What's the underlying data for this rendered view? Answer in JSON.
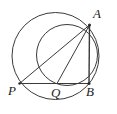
{
  "figure": {
    "kind": "geometry-diagram",
    "width": 117,
    "height": 114,
    "background_color": "#ffffff",
    "stroke_color": "#3a3a3a",
    "label_color": "#222222"
  },
  "points": {
    "A": {
      "label": "A",
      "x": 89.5,
      "y": 25.0,
      "label_x": 93,
      "label_y": 7
    },
    "B": {
      "label": "B",
      "x": 89.0,
      "y": 83.5,
      "label_x": 86,
      "label_y": 85
    },
    "P": {
      "label": "P",
      "x": 19.5,
      "y": 83.5,
      "label_x": 8,
      "label_y": 84
    },
    "Q": {
      "label": "Q",
      "x": 57.0,
      "y": 83.5,
      "label_x": 51,
      "label_y": 86
    }
  },
  "circles": [
    {
      "name": "large-circle",
      "cx": 55.5,
      "cy": 56.0,
      "r": 43.5
    },
    {
      "name": "small-circle",
      "cx": 67.0,
      "cy": 55.0,
      "r": 30.5
    }
  ],
  "segments": [
    {
      "name": "segment-PA",
      "from": "P",
      "to": "A"
    },
    {
      "name": "segment-PB",
      "from": "P",
      "to": "B"
    },
    {
      "name": "segment-AB",
      "from": "A",
      "to": "B"
    },
    {
      "name": "segment-AQ",
      "from": "A",
      "to": "Q"
    }
  ]
}
